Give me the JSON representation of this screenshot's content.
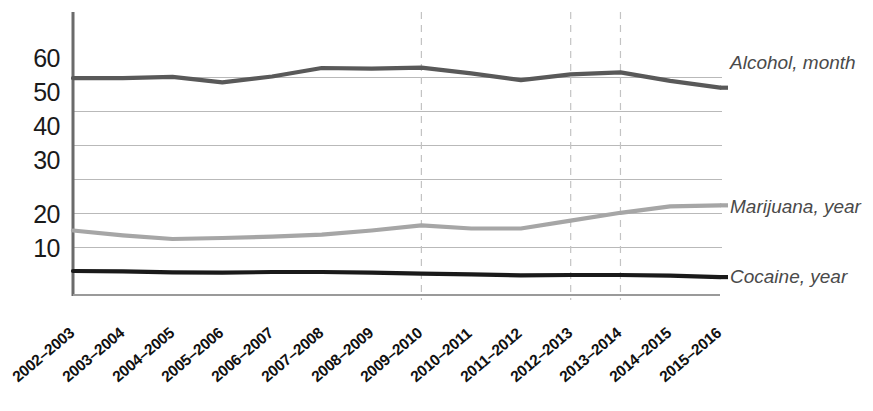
{
  "chart_data": {
    "type": "line",
    "title": "",
    "xlabel": "",
    "ylabel": "",
    "ylim": [
      0,
      65
    ],
    "yticks": [
      10,
      20,
      30,
      40,
      50,
      60
    ],
    "grid": "horizontal gridlines at every 10 units; dashed vertical gridlines at 2009-2010, 2012-2013, 2013-2014",
    "legend_position": "right-of-plot, inline at series end",
    "categories": [
      "2002-2003",
      "2003-2004",
      "2004-2005",
      "2005-2006",
      "2006-2007",
      "2007-2008",
      "2008-2009",
      "2009-2010",
      "2010-2011",
      "2011-2012",
      "2012-2013",
      "2013-2014",
      "2014-2015",
      "2015-2016"
    ],
    "series": [
      {
        "name": "Alcohol, month",
        "color": "#595959",
        "values": [
          59.8,
          59.8,
          60.2,
          58.6,
          60.3,
          62.8,
          62.6,
          62.9,
          61.2,
          59.2,
          60.9,
          61.5,
          59.0,
          57.0
        ]
      },
      {
        "name": "Marijuana, year",
        "color": "#a6a6a6",
        "values": [
          15.0,
          13.6,
          12.5,
          12.8,
          13.2,
          13.8,
          15.0,
          16.5,
          15.6,
          15.6,
          17.9,
          20.2,
          22.1,
          22.4
        ]
      },
      {
        "name": "Cocaine, year",
        "color": "#1a1a1a",
        "values": [
          3.1,
          3.0,
          2.7,
          2.6,
          2.8,
          2.8,
          2.6,
          2.3,
          2.1,
          1.8,
          1.9,
          1.9,
          1.7,
          1.3
        ]
      }
    ]
  },
  "axis": {
    "y_tick_labels": [
      "60",
      "50",
      "40",
      "30",
      "20",
      "10"
    ]
  },
  "x_axis": {
    "tick_labels": [
      "2002-2003",
      "2003-2004",
      "2004-2005",
      "2005-2006",
      "2006-2007",
      "2007-2008",
      "2008-2009",
      "2009-2010",
      "2010-2011",
      "2011-2012",
      "2012-2013",
      "2013-2014",
      "2014-2015",
      "2015-2016"
    ]
  },
  "legend": {
    "items": [
      {
        "label": "Alcohol, month",
        "color": "#595959"
      },
      {
        "label": "Marijuana, year",
        "color": "#a6a6a6"
      },
      {
        "label": "Cocaine, year",
        "color": "#1a1a1a"
      }
    ]
  }
}
